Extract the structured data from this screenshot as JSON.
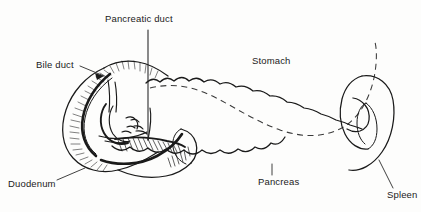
{
  "figure": {
    "kind": "anatomical-line-diagram",
    "width": 421,
    "height": 212,
    "background_color": "#fdfdfc",
    "ink_color": "#1a1a1a"
  },
  "labels": {
    "pancreatic_duct": "Pancreatic duct",
    "bile_duct": "Bile duct",
    "stomach": "Stomach",
    "duodenum": "Duodenum",
    "pancreas": "Pancreas",
    "spleen": "Spleen"
  },
  "structures": [
    {
      "name": "duodenum",
      "label": "Duodenum",
      "style": "solid outline with dense hatched shading",
      "position": "left, C-shaped loop"
    },
    {
      "name": "pancreas",
      "label": "Pancreas",
      "style": "solid scalloped lobulated outline",
      "position": "center, extending right from duodenal loop"
    },
    {
      "name": "stomach",
      "label": "Stomach",
      "style": "dashed outline (overlying organ shown transparent)",
      "position": "upper center-right, above pancreas"
    },
    {
      "name": "spleen",
      "label": "Spleen",
      "style": "solid curved hook outline",
      "position": "far right"
    },
    {
      "name": "bile-duct",
      "label": "Bile duct",
      "style": "thin solid duct line entering duodenum",
      "position": "upper left, arrowhead leader"
    },
    {
      "name": "pancreatic-duct",
      "label": "Pancreatic duct",
      "style": "thin solid duct line with vertical leader",
      "position": "center left, within pancreas head"
    }
  ]
}
